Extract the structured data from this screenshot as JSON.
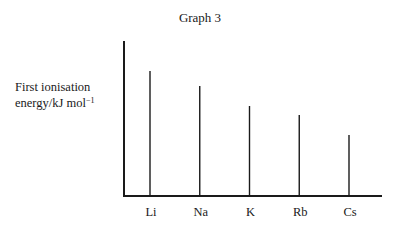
{
  "chart_data": {
    "type": "bar",
    "title": "Graph 3",
    "xlabel": "",
    "ylabel": "First ionisation energy/kJ mol⁻¹",
    "categories": [
      "Li",
      "Na",
      "K",
      "Rb",
      "Cs"
    ],
    "values": [
      125,
      110,
      90,
      81,
      61
    ],
    "value_note": "No numeric scale on the y-axis; values are relative bar heights in pixels measured from the x-axis",
    "ylim": [
      0,
      155
    ],
    "grid": false,
    "legend": null,
    "style": "thin vertical lines (stick bars)"
  },
  "labels": {
    "title": "Graph 3",
    "ylabel_line1": "First ionisation",
    "ylabel_line2": "energy/kJ mol",
    "ylabel_sup": "−1"
  }
}
